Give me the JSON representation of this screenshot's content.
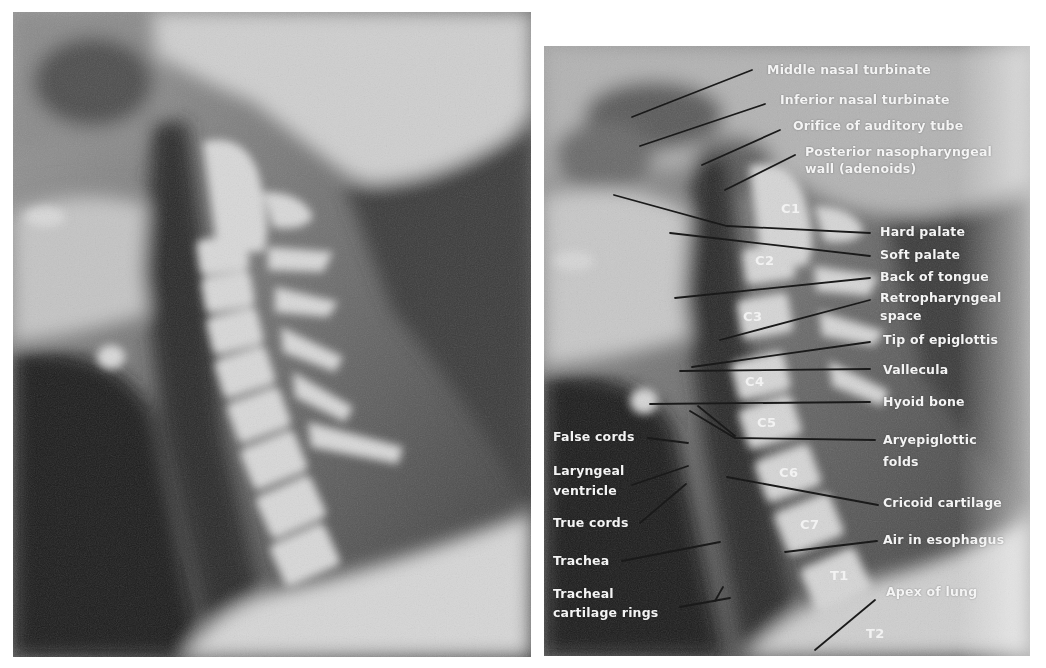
{
  "figure": {
    "left_panel": {
      "description": "Lateral radiograph of the neck (unlabeled)"
    },
    "right_panel": {
      "description": "Lateral radiograph of the neck (labeled)"
    }
  },
  "labels_right": [
    {
      "id": "middle-nasal-turbinate",
      "text": "Middle nasal turbinate"
    },
    {
      "id": "inferior-nasal-turbinate",
      "text": "Inferior nasal turbinate"
    },
    {
      "id": "orifice-auditory-tube",
      "text": "Orifice of auditory tube"
    },
    {
      "id": "posterior-nasopharyngeal-wall",
      "line1": "Posterior nasopharyngeal",
      "line2": "wall (adenoids)"
    },
    {
      "id": "hard-palate",
      "text": "Hard palate"
    },
    {
      "id": "soft-palate",
      "text": "Soft palate"
    },
    {
      "id": "back-of-tongue",
      "text": "Back of tongue"
    },
    {
      "id": "retropharyngeal-space",
      "line1": "Retropharyngeal",
      "line2": "space"
    },
    {
      "id": "tip-of-epiglottis",
      "text": "Tip of epiglottis"
    },
    {
      "id": "vallecula",
      "text": "Vallecula"
    },
    {
      "id": "hyoid-bone",
      "text": "Hyoid bone"
    },
    {
      "id": "aryepiglottic-folds",
      "line1": "Aryepiglottic",
      "line2": "folds"
    },
    {
      "id": "cricoid-cartilage",
      "text": "Cricoid cartilage"
    },
    {
      "id": "air-in-esophagus",
      "text": "Air in esophagus"
    },
    {
      "id": "apex-of-lung",
      "text": "Apex of lung"
    }
  ],
  "labels_left": [
    {
      "id": "false-cords",
      "text": "False cords"
    },
    {
      "id": "laryngeal-ventricle",
      "line1": "Laryngeal",
      "line2": "ventricle"
    },
    {
      "id": "true-cords",
      "text": "True cords"
    },
    {
      "id": "trachea",
      "text": "Trachea"
    },
    {
      "id": "tracheal-cartilage-rings",
      "line1": "Tracheal",
      "line2": "cartilage rings"
    }
  ],
  "vertebrae": [
    "C1",
    "C2",
    "C3",
    "C4",
    "C5",
    "C6",
    "C7",
    "T1",
    "T2"
  ],
  "colors": {
    "label_text": "#f4f4f4",
    "leader_line": "#1a1a1a",
    "background": "#ffffff"
  }
}
